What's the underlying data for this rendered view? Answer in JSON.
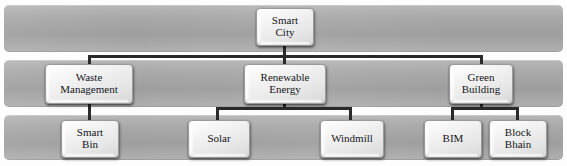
{
  "diagram": {
    "type": "hierarchy-tree",
    "levels": 3,
    "colors": {
      "band": "#a8a8a8",
      "node_fill": "#f0f0f0",
      "node_border": "#9a9a9a",
      "connector": "#2a2a2a",
      "text": "#15151a",
      "background": "#ffffff"
    },
    "root": {
      "id": "smart-city",
      "label": "Smart City",
      "lines": [
        "Smart",
        "City"
      ]
    },
    "level2": [
      {
        "id": "waste-management",
        "label": "Waste Management",
        "lines": [
          "Waste",
          "Management"
        ]
      },
      {
        "id": "renewable-energy",
        "label": "Renewable Energy",
        "lines": [
          "Renewable",
          "Energy"
        ]
      },
      {
        "id": "green-building",
        "label": "Green Building",
        "lines": [
          "Green",
          "Building"
        ]
      }
    ],
    "level3": [
      {
        "id": "smart-bin",
        "label": "Smart Bin",
        "lines": [
          "Smart",
          "Bin"
        ],
        "parent": "waste-management"
      },
      {
        "id": "solar",
        "label": "Solar",
        "lines": [
          "Solar"
        ],
        "parent": "renewable-energy"
      },
      {
        "id": "windmill",
        "label": "Windmill",
        "lines": [
          "Windmill"
        ],
        "parent": "renewable-energy"
      },
      {
        "id": "bim",
        "label": "BIM",
        "lines": [
          "BIM"
        ],
        "parent": "green-building"
      },
      {
        "id": "block-bhain",
        "label": "Block Bhain",
        "lines": [
          "Block",
          "Bhain"
        ],
        "parent": "green-building"
      }
    ]
  }
}
